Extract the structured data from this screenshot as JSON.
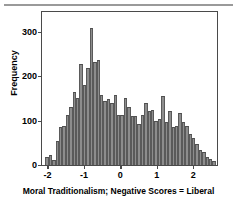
{
  "figure": {
    "background_color": "#ffffff",
    "frame_color": "#4a4a4a",
    "bar_fill_color": "#8d8d8d",
    "bar_edge_color": "#4f4f4f",
    "top_rule_color": "#9a9a9a"
  },
  "chart_data": {
    "type": "bar",
    "title": "",
    "subtitle": "",
    "xlabel": "Moral Traditionalism; Negative Scores = Liberal",
    "ylabel": "Frequency",
    "xlim": [
      -2.15,
      2.65
    ],
    "ylim": [
      0,
      345
    ],
    "grid": false,
    "legend": null,
    "xticks": [
      -2,
      -1,
      0,
      1,
      2
    ],
    "xticklabels": [
      "-2",
      "-1",
      "0",
      "1",
      "2"
    ],
    "yticks": [
      0,
      100,
      200,
      300
    ],
    "yticklabels": [
      "0",
      "100",
      "200",
      "300"
    ],
    "bin_width": 0.0935,
    "bin_left_edges": [
      -2.15,
      -2.057,
      -1.963,
      -1.87,
      -1.776,
      -1.683,
      -1.589,
      -1.496,
      -1.402,
      -1.309,
      -1.215,
      -1.122,
      -1.028,
      -0.935,
      -0.841,
      -0.748,
      -0.654,
      -0.561,
      -0.467,
      -0.374,
      -0.28,
      -0.187,
      -0.093,
      0.0,
      0.094,
      0.187,
      0.281,
      0.374,
      0.468,
      0.561,
      0.655,
      0.748,
      0.842,
      0.935,
      1.029,
      1.122,
      1.216,
      1.309,
      1.403,
      1.496,
      1.59,
      1.683,
      1.777,
      1.87,
      1.964,
      2.057,
      2.151,
      2.244,
      2.338,
      2.431,
      2.525
    ],
    "values": [
      0,
      18,
      22,
      12,
      55,
      85,
      88,
      113,
      130,
      165,
      150,
      228,
      180,
      218,
      308,
      232,
      237,
      158,
      145,
      148,
      140,
      158,
      112,
      113,
      151,
      130,
      110,
      110,
      92,
      113,
      139,
      122,
      125,
      100,
      104,
      156,
      96,
      122,
      85,
      88,
      117,
      97,
      88,
      70,
      60,
      47,
      33,
      30,
      19,
      13,
      10
    ],
    "series": [
      {
        "name": "Moral Traditionalism distribution",
        "values": [
          0,
          18,
          22,
          12,
          55,
          85,
          88,
          113,
          130,
          165,
          150,
          228,
          180,
          218,
          308,
          232,
          237,
          158,
          145,
          148,
          140,
          158,
          112,
          113,
          151,
          130,
          110,
          110,
          92,
          113,
          139,
          122,
          125,
          100,
          104,
          156,
          96,
          122,
          85,
          88,
          117,
          97,
          88,
          70,
          60,
          47,
          33,
          30,
          19,
          13,
          10
        ]
      }
    ],
    "peak": {
      "value": 308,
      "x": 0.0,
      "bin_index": 14
    },
    "annotations": []
  }
}
